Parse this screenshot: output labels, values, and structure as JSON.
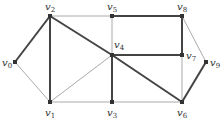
{
  "diagram": {
    "type": "graph",
    "colors": {
      "edge": "#555555",
      "node": "#333333",
      "background": "#ffffff"
    },
    "nodes": [
      {
        "id": "v0",
        "label": "v",
        "sub": "0",
        "x": 15,
        "y": 62,
        "lx": 2,
        "ly": 66
      },
      {
        "id": "v1",
        "label": "v",
        "sub": "1",
        "x": 50,
        "y": 102,
        "lx": 45,
        "ly": 116
      },
      {
        "id": "v2",
        "label": "v",
        "sub": "2",
        "x": 50,
        "y": 16,
        "lx": 45,
        "ly": 10
      },
      {
        "id": "v3",
        "label": "v",
        "sub": "3",
        "x": 112,
        "y": 102,
        "lx": 107,
        "ly": 116
      },
      {
        "id": "v4",
        "label": "v",
        "sub": "4",
        "x": 112,
        "y": 55,
        "lx": 114,
        "ly": 48
      },
      {
        "id": "v5",
        "label": "v",
        "sub": "5",
        "x": 112,
        "y": 16,
        "lx": 107,
        "ly": 10
      },
      {
        "id": "v6",
        "label": "v",
        "sub": "6",
        "x": 182,
        "y": 102,
        "lx": 177,
        "ly": 116
      },
      {
        "id": "v7",
        "label": "v",
        "sub": "7",
        "x": 182,
        "y": 55,
        "lx": 186,
        "ly": 59
      },
      {
        "id": "v8",
        "label": "v",
        "sub": "8",
        "x": 182,
        "y": 16,
        "lx": 177,
        "ly": 10
      },
      {
        "id": "v9",
        "label": "v",
        "sub": "9",
        "x": 206,
        "y": 62,
        "lx": 210,
        "ly": 66
      }
    ],
    "edges": [
      {
        "from": "v0",
        "to": "v2",
        "bold": true
      },
      {
        "from": "v0",
        "to": "v1",
        "bold": false
      },
      {
        "from": "v2",
        "to": "v1",
        "bold": true
      },
      {
        "from": "v2",
        "to": "v5",
        "bold": false
      },
      {
        "from": "v2",
        "to": "v4",
        "bold": true
      },
      {
        "from": "v4",
        "to": "v6",
        "bold": true
      },
      {
        "from": "v1",
        "to": "v4",
        "bold": false
      },
      {
        "from": "v1",
        "to": "v3",
        "bold": false
      },
      {
        "from": "v5",
        "to": "v4",
        "bold": false
      },
      {
        "from": "v5",
        "to": "v8",
        "bold": true
      },
      {
        "from": "v8",
        "to": "v7",
        "bold": true
      },
      {
        "from": "v4",
        "to": "v7",
        "bold": true
      },
      {
        "from": "v4",
        "to": "v3",
        "bold": true
      },
      {
        "from": "v3",
        "to": "v6",
        "bold": false
      },
      {
        "from": "v7",
        "to": "v6",
        "bold": false
      },
      {
        "from": "v8",
        "to": "v9",
        "bold": false
      },
      {
        "from": "v9",
        "to": "v6",
        "bold": true
      }
    ]
  }
}
